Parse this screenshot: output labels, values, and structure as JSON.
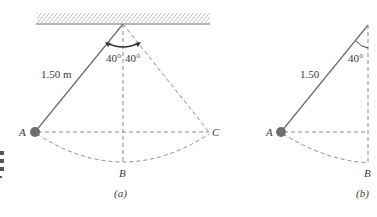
{
  "figure": {
    "type": "pendulum-diagram",
    "colors": {
      "line": "#6b6b6b",
      "dashed": "#8a8a8a",
      "bob": "#6e6e6e",
      "text": "#3a3a3a",
      "background": "#ffffff"
    },
    "panel_a": {
      "caption": "(a)",
      "length_label": "1.50 m",
      "angle_left": "40°",
      "angle_right": "40°",
      "point_A": "A",
      "point_B": "B",
      "point_C": "C"
    },
    "panel_b": {
      "caption": "(b)",
      "length_label": "1.50",
      "angle": "40°",
      "point_A": "A",
      "point_B": "B"
    }
  }
}
